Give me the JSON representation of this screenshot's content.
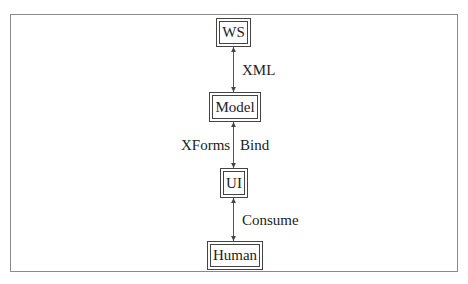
{
  "diagram": {
    "nodes": [
      {
        "id": "ws",
        "label": "WS"
      },
      {
        "id": "model",
        "label": "Model"
      },
      {
        "id": "ui",
        "label": "UI"
      },
      {
        "id": "human",
        "label": "Human"
      }
    ],
    "edges": [
      {
        "from": "ws",
        "to": "model",
        "direction": "bidirectional",
        "labels": [
          "XML"
        ]
      },
      {
        "from": "model",
        "to": "ui",
        "direction": "bidirectional",
        "labels": [
          "XForms",
          "Bind"
        ]
      },
      {
        "from": "ui",
        "to": "human",
        "direction": "bidirectional",
        "labels": [
          "Consume"
        ]
      }
    ],
    "colors": {
      "line": "#444444",
      "frame": "#8a8a8a",
      "background": "#ffffff"
    }
  }
}
